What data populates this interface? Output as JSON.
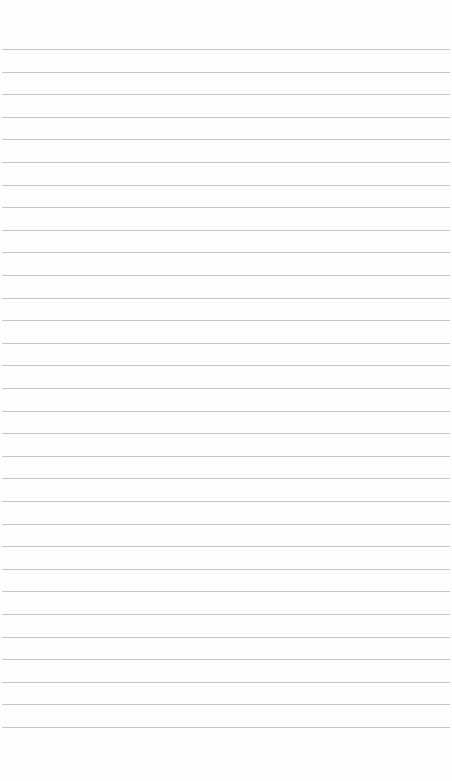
{
  "page": {
    "type": "lined-paper",
    "background_color": "#fefefe",
    "line_color": "#c4c4c4",
    "line_count": 31,
    "first_line_y": 49,
    "line_spacing": 22.6,
    "line_left": 2,
    "line_right": 450
  }
}
